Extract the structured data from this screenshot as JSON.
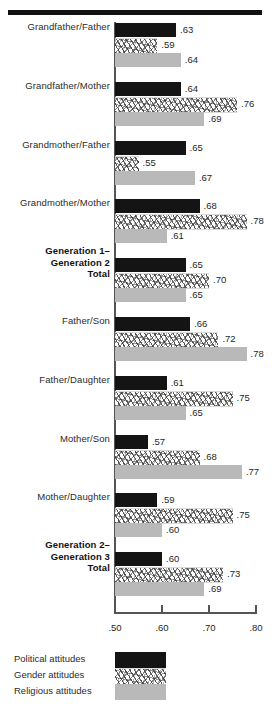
{
  "chart_data": {
    "type": "bar",
    "orientation": "horizontal",
    "title": "",
    "subtitle": "",
    "xlabel": "",
    "ylabel": "",
    "xlim": [
      0.5,
      0.8
    ],
    "xticks": [
      ".50",
      ".60",
      ".70",
      ".80"
    ],
    "xtick_values": [
      0.5,
      0.6,
      0.7,
      0.8
    ],
    "grid": false,
    "legend_position": "bottom-left",
    "categories": [
      "Grandfather/Father",
      "Grandfather/Mother",
      "Grandmother/Father",
      "Grandmother/Mother",
      "Generation 1–\nGeneration 2\nTotal",
      "Father/Son",
      "Father/Daughter",
      "Mother/Son",
      "Mother/Daughter",
      "Generation 2–\nGeneration 3\nTotal"
    ],
    "category_bold": [
      false,
      false,
      false,
      false,
      true,
      false,
      false,
      false,
      false,
      true
    ],
    "series": [
      {
        "name": "Political attitudes",
        "pattern": "solid-black",
        "color": "#141414",
        "values": [
          0.63,
          0.64,
          0.65,
          0.68,
          0.65,
          0.66,
          0.61,
          0.57,
          0.59,
          0.6
        ],
        "labels": [
          ".63",
          ".64",
          ".65",
          ".68",
          ".65",
          ".66",
          ".61",
          ".57",
          ".59",
          ".60"
        ]
      },
      {
        "name": "Gender attitudes",
        "pattern": "hatched",
        "color": "#ffffff",
        "values": [
          0.59,
          0.76,
          0.55,
          0.78,
          0.7,
          0.72,
          0.75,
          0.68,
          0.75,
          0.73
        ],
        "labels": [
          ".59",
          ".76",
          ".55",
          ".78",
          ".70",
          ".72",
          ".75",
          ".68",
          ".75",
          ".73"
        ]
      },
      {
        "name": "Religious attitudes",
        "pattern": "solid-gray",
        "color": "#b9b9b9",
        "values": [
          0.64,
          0.69,
          0.67,
          0.61,
          0.65,
          0.78,
          0.65,
          0.77,
          0.6,
          0.69
        ],
        "labels": [
          ".64",
          ".69",
          ".67",
          ".61",
          ".65",
          ".78",
          ".65",
          ".77",
          ".60",
          ".69"
        ]
      }
    ]
  },
  "legend": {
    "items": [
      {
        "label": "Political attitudes",
        "swatch": "solid-black"
      },
      {
        "label": "Gender attitudes",
        "swatch": "hatched"
      },
      {
        "label": "Religious attitudes",
        "swatch": "solid-gray"
      }
    ]
  },
  "colors": {
    "black_bar": "#141414",
    "gray_bar": "#b9b9b9",
    "rule": "#111111",
    "axis": "#555555",
    "text": "#1f1f1f"
  }
}
